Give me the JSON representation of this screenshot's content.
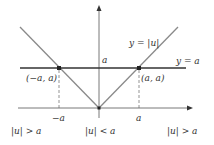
{
  "diagram": {
    "colors": {
      "axis": "#555555",
      "v_lines": "#8a8a8a",
      "horizontal_line": "#333333",
      "dashed": "#666666",
      "points": "#222222",
      "text": "#333333"
    },
    "labels": {
      "y_abs": "y = |u|",
      "y_a": "y = a",
      "a_on_axis": "a",
      "point_left": "(−a, a)",
      "point_right": "(a, a)",
      "tick_neg_a": "−a",
      "tick_a": "a",
      "region_left": "|u| > a",
      "region_middle": "|u| < a",
      "region_right": "|u| > a"
    },
    "points": [
      {
        "name": "left-intersection",
        "x": 59,
        "y": 68
      },
      {
        "name": "right-intersection",
        "x": 139,
        "y": 68
      },
      {
        "name": "origin",
        "x": 99,
        "y": 108
      }
    ]
  }
}
